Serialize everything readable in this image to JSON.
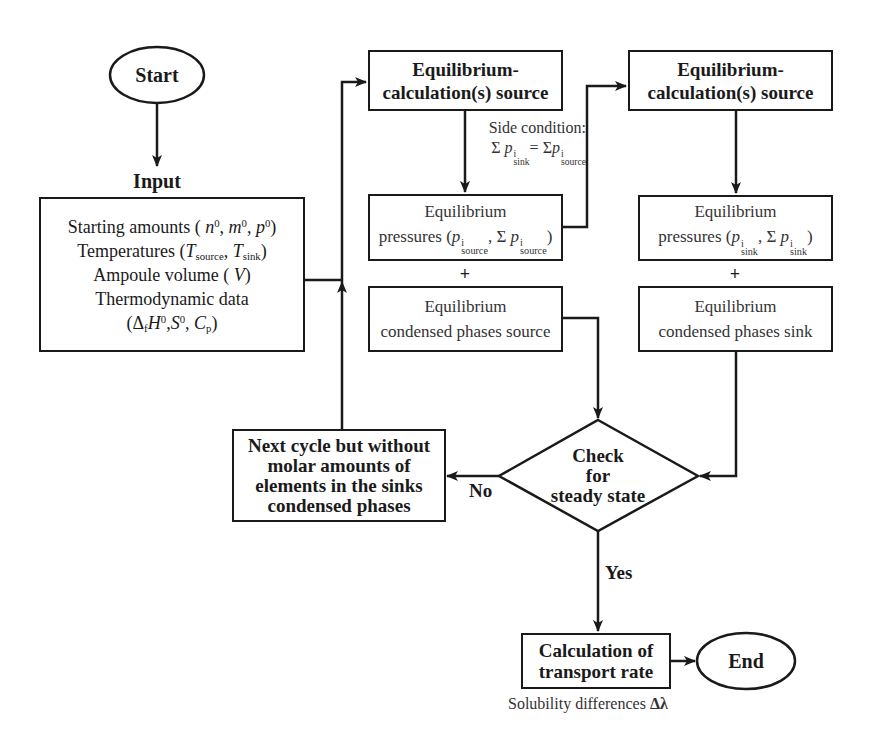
{
  "diagram": {
    "type": "flowchart",
    "nodes": {
      "start": {
        "label": "Start",
        "shape": "ellipse"
      },
      "input_heading": {
        "label": "Input"
      },
      "input": {
        "shape": "rectangle",
        "lines": [
          "Starting amounts ( n⁰, m⁰, p⁰)",
          "Temperatures (T_source, T_sink)",
          "Ampoule volume ( V)",
          "Thermodynamic data",
          "(Δ_f H⁰, S⁰, C_p)"
        ],
        "line1_text": "Starting amounts ( ",
        "line1_n": "n",
        "line1_m": "m",
        "line1_p": "p",
        "sup0": "0",
        "line2_text": "Temperatures (",
        "line2_T": "T",
        "sub_source": "source",
        "sub_sink": "sink",
        "line3_text": "Ampoule volume ( ",
        "line3_V": "V",
        "line4_text": "Thermodynamic data",
        "line5_delta": "Δ",
        "sub_f": "f",
        "line5_H": "H",
        "line5_S": "S",
        "line5_C": "C",
        "sub_p": "p"
      },
      "eq_calc_source_1": {
        "shape": "rectangle",
        "line1": "Equilibrium-",
        "line2": "calculation(s) source"
      },
      "side_condition": {
        "line1": "Side condition:",
        "sigma": "Σ",
        "p": "p",
        "sup_i": "i",
        "sub_sink": "sink",
        "equals": "=",
        "sub_source": "source",
        "formula": "Σ p^i_sink = Σ p^i_source"
      },
      "eq_pressures_source": {
        "shape": "rectangle",
        "line1": "Equilibrium",
        "line2_prefix": "pressures (",
        "p": "p",
        "sup_i": "i",
        "sub": "source",
        "sigma": "Σ",
        "formula": "pressures (p^i_source, Σ p^i_source)"
      },
      "plus_source": {
        "label": "+"
      },
      "eq_condensed_source": {
        "shape": "rectangle",
        "line1": "Equilibrium",
        "line2": "condensed phases source"
      },
      "eq_calc_source_2": {
        "shape": "rectangle",
        "line1": "Equilibrium-",
        "line2": "calculation(s) source"
      },
      "eq_pressures_sink": {
        "shape": "rectangle",
        "line1": "Equilibrium",
        "line2_prefix": "pressures (",
        "p": "p",
        "sup_i": "i",
        "sub": "sink",
        "sigma": "Σ",
        "formula": "pressures (p^i_sink, Σ p^i_sink)"
      },
      "plus_sink": {
        "label": "+"
      },
      "eq_condensed_sink": {
        "shape": "rectangle",
        "line1": "Equilibrium",
        "line2": "condensed phases sink"
      },
      "check": {
        "shape": "diamond",
        "line1": "Check",
        "line2": "for",
        "line3": "steady state"
      },
      "next_cycle": {
        "shape": "rectangle",
        "line1": "Next cycle but without",
        "line2": "molar amounts of",
        "line3": "elements in the sinks",
        "line4": "condensed phases"
      },
      "transport_rate": {
        "shape": "rectangle",
        "line1": "Calculation of",
        "line2": "transport rate"
      },
      "end": {
        "label": "End",
        "shape": "ellipse"
      },
      "solubility_note": {
        "label": "Solubility differences",
        "symbol": "Δλ"
      }
    },
    "edge_labels": {
      "no": "No",
      "yes": "Yes"
    },
    "edges": [
      [
        "start",
        "input"
      ],
      [
        "input",
        "eq_calc_source_1"
      ],
      [
        "eq_calc_source_1",
        "eq_pressures_source"
      ],
      [
        "eq_pressures_source",
        "eq_calc_source_2"
      ],
      [
        "eq_calc_source_2",
        "eq_pressures_sink"
      ],
      [
        "eq_condensed_source",
        "check"
      ],
      [
        "eq_condensed_sink",
        "check"
      ],
      [
        "check",
        "next_cycle",
        "No"
      ],
      [
        "next_cycle",
        "eq_calc_source_1"
      ],
      [
        "check",
        "transport_rate",
        "Yes"
      ],
      [
        "transport_rate",
        "end"
      ]
    ],
    "colors": {
      "stroke": "#1a1a1a",
      "background": "#ffffff"
    }
  }
}
